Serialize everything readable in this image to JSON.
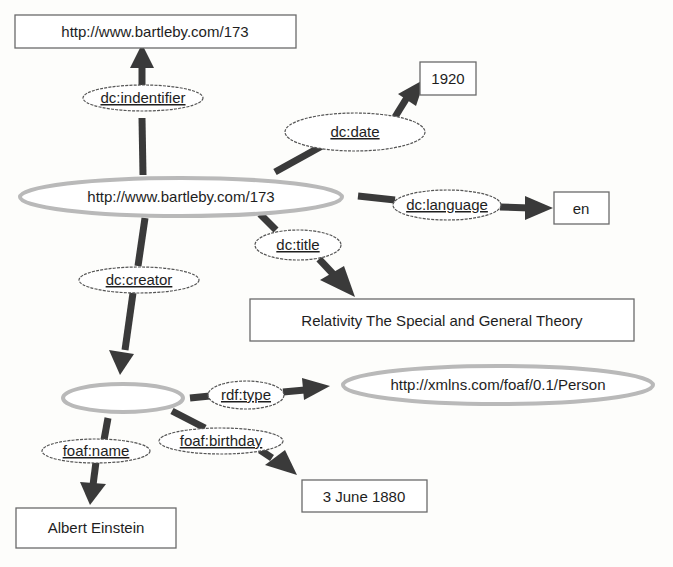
{
  "diagram": {
    "type": "RDF graph",
    "nodes": {
      "identifier_value": {
        "label": "http://www.bartleby.com/173",
        "shape": "box"
      },
      "date_value": {
        "label": "1920",
        "shape": "box"
      },
      "subject": {
        "label": "http://www.bartleby.com/173",
        "shape": "resource-ellipse"
      },
      "language_value": {
        "label": "en",
        "shape": "box"
      },
      "title_value": {
        "label": "Relativity The Special and General Theory",
        "shape": "box"
      },
      "blank_creator": {
        "label": "",
        "shape": "resource-ellipse"
      },
      "person_type": {
        "label": "http://xmlns.com/foaf/0.1/Person",
        "shape": "resource-ellipse"
      },
      "name_value": {
        "label": "Albert Einstein",
        "shape": "box"
      },
      "birthday_value": {
        "label": "3 June 1880",
        "shape": "box"
      }
    },
    "properties": {
      "identifier": "dc:indentifier",
      "date": "dc:date",
      "language": "dc:language",
      "title": "dc:title",
      "creator": "dc:creator",
      "type": "rdf:type",
      "name": "foaf:name",
      "birthday": "foaf:birthday"
    },
    "edges": [
      {
        "from": "subject",
        "property": "identifier",
        "to": "identifier_value"
      },
      {
        "from": "subject",
        "property": "date",
        "to": "date_value"
      },
      {
        "from": "subject",
        "property": "language",
        "to": "language_value"
      },
      {
        "from": "subject",
        "property": "title",
        "to": "title_value"
      },
      {
        "from": "subject",
        "property": "creator",
        "to": "blank_creator"
      },
      {
        "from": "blank_creator",
        "property": "type",
        "to": "person_type"
      },
      {
        "from": "blank_creator",
        "property": "name",
        "to": "name_value"
      },
      {
        "from": "blank_creator",
        "property": "birthday",
        "to": "birthday_value"
      }
    ],
    "colors": {
      "edge": "#3a3a3a",
      "resource_outline": "#b9b9b9",
      "literal_border": "#6a6a6a",
      "background": "#fdfdfb"
    }
  }
}
